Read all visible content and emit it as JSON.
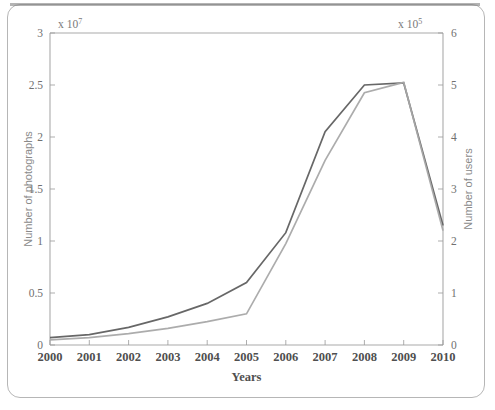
{
  "chart_data": {
    "type": "line",
    "title": "",
    "xlabel": "Years",
    "ylabel": "Number of photographs",
    "y2label": "Number of users",
    "x": [
      2000,
      2001,
      2002,
      2003,
      2004,
      2005,
      2006,
      2007,
      2008,
      2009,
      2010
    ],
    "categories": [
      "2000",
      "2001",
      "2002",
      "2003",
      "2004",
      "2005",
      "2006",
      "2007",
      "2008",
      "2009",
      "2010"
    ],
    "left_axis": {
      "label": "Number of photographs",
      "exponent_text": "x 10",
      "exponent_power": "7",
      "multiplier": 10000000,
      "ticks": [
        0,
        0.5,
        1,
        1.5,
        2,
        2.5,
        3
      ],
      "tick_labels": [
        "0",
        "0.5",
        "1",
        "1.5",
        "2",
        "2.5",
        "3"
      ],
      "ylim": [
        0,
        3
      ]
    },
    "right_axis": {
      "label": "Number of users",
      "exponent_text": "x 10",
      "exponent_power": "5",
      "multiplier": 100000,
      "ticks": [
        0,
        1,
        2,
        3,
        4,
        5,
        6
      ],
      "tick_labels": [
        "0",
        "1",
        "2",
        "3",
        "4",
        "5",
        "6"
      ],
      "ylim": [
        0,
        6
      ]
    },
    "xlim": [
      2000,
      2010
    ],
    "grid": false,
    "legend": "none",
    "series": [
      {
        "name": "Number of photographs",
        "axis": "left",
        "units": "x 10^7",
        "color": "#5a5a5a",
        "values": [
          0.07,
          0.1,
          0.17,
          0.27,
          0.4,
          0.6,
          1.08,
          2.05,
          2.5,
          2.52,
          1.15
        ]
      },
      {
        "name": "Number of users",
        "axis": "right",
        "units": "x 10^5",
        "color": "#a8a8a8",
        "values": [
          0.1,
          0.14,
          0.22,
          0.32,
          0.45,
          0.6,
          1.95,
          3.55,
          4.85,
          5.05,
          2.2
        ]
      }
    ]
  },
  "figure": {
    "xlabel": "Years",
    "left_label": "Number of photographs",
    "right_label": "Number of users"
  }
}
